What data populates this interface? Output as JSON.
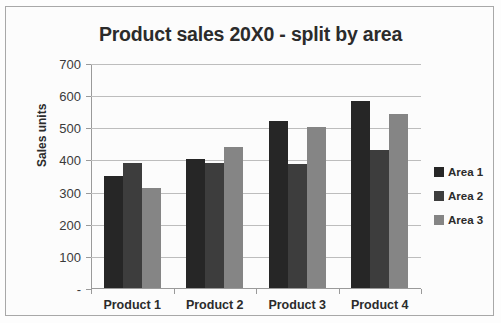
{
  "chart_data": {
    "type": "bar",
    "title": "Product sales 20X0 - split by area",
    "xlabel": "",
    "ylabel": "Sales units",
    "categories": [
      "Product 1",
      "Product 2",
      "Product 3",
      "Product 4"
    ],
    "series": [
      {
        "name": "Area 1",
        "color": "#262626",
        "values": [
          350,
          400,
          520,
          583
        ]
      },
      {
        "name": "Area 2",
        "color": "#3d3d3d",
        "values": [
          390,
          390,
          385,
          430
        ]
      },
      {
        "name": "Area 3",
        "color": "#858585",
        "values": [
          310,
          440,
          500,
          540
        ]
      }
    ],
    "ylim": [
      0,
      700
    ],
    "ytick_values": [
      0,
      100,
      200,
      300,
      400,
      500,
      600,
      700
    ],
    "ytick_labels": [
      "-",
      "100",
      "200",
      "300",
      "400",
      "500",
      "600",
      "700"
    ],
    "grid": "horizontal",
    "legend_position": "right",
    "annotations": []
  },
  "figure": {
    "background_color": "#fcfcfc",
    "border_color": "#a8a8a8",
    "gridline_color": "#bdbdbd",
    "axis_color": "#9a9a9a",
    "text_color": "#2b2b2b"
  }
}
